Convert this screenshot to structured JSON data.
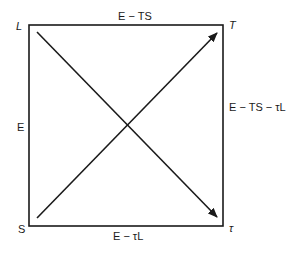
{
  "diagram": {
    "corners": {
      "top_left": "L",
      "top_right": "T",
      "bottom_left": "S",
      "bottom_right": "τ"
    },
    "edges": {
      "top": "E − TS",
      "bottom": "E − τL",
      "left": "E",
      "right": "E − TS − τL"
    },
    "arrows": [
      {
        "from": "S",
        "to": "T"
      },
      {
        "from": "L",
        "to": "τ"
      }
    ],
    "colors": {
      "line": "#1a1a1a",
      "background": "#ffffff"
    }
  }
}
